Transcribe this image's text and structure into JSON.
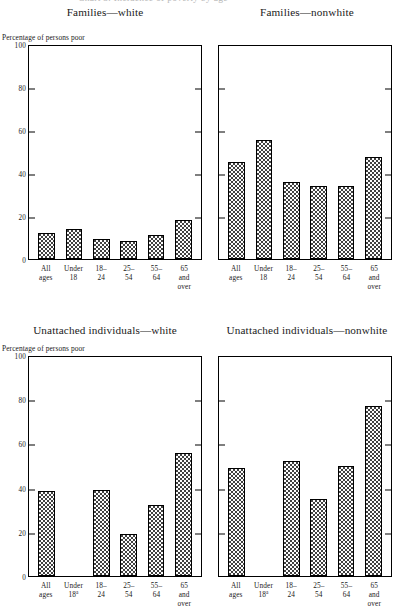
{
  "page": {
    "cut_off_header": "Chart 3. Incidence of poverty by age",
    "axis_caption": "Percentage of persons poor",
    "footnote_marker": "a"
  },
  "chart_data": [
    {
      "type": "bar",
      "title": "Families—white",
      "ylabel": "Percentage of persons poor",
      "xlabel": "",
      "categories": [
        "All ages",
        "Under 18",
        "18–24",
        "25–54",
        "55–64",
        "65 and over"
      ],
      "category_lines": [
        [
          "All",
          "ages"
        ],
        [
          "Under",
          "18"
        ],
        [
          "18–",
          "24"
        ],
        [
          "25–",
          "54"
        ],
        [
          "55–",
          "64"
        ],
        [
          "65",
          "and",
          "over"
        ]
      ],
      "values": [
        12,
        14,
        9.5,
        8.5,
        11,
        18
      ],
      "ylim": [
        0,
        100
      ],
      "yticks": [
        0,
        20,
        40,
        60,
        80,
        100
      ],
      "ytick_labels": [
        "0",
        "20",
        "40",
        "60",
        "80",
        "100"
      ],
      "grid": false,
      "legend": "none"
    },
    {
      "type": "bar",
      "title": "Families—nonwhite",
      "ylabel": "",
      "xlabel": "",
      "categories": [
        "All ages",
        "Under 18",
        "18–24",
        "25–54",
        "55–64",
        "65 and over"
      ],
      "category_lines": [
        [
          "All",
          "ages"
        ],
        [
          "Under",
          "18"
        ],
        [
          "18–",
          "24"
        ],
        [
          "25–",
          "54"
        ],
        [
          "55–",
          "64"
        ],
        [
          "65",
          "and",
          "over"
        ]
      ],
      "values": [
        45,
        55.5,
        36,
        34,
        34,
        47.5
      ],
      "ylim": [
        0,
        100
      ],
      "yticks": [
        0,
        20,
        40,
        60,
        80,
        100
      ],
      "ytick_labels": [
        "",
        "",
        "",
        "",
        "",
        ""
      ],
      "grid": false,
      "legend": "none"
    },
    {
      "type": "bar",
      "title": "Unattached individuals—white",
      "ylabel": "Percentage of persons poor",
      "xlabel": "",
      "categories": [
        "All ages",
        "Under 18a",
        "18–24",
        "25–54",
        "55–64",
        "65 and over"
      ],
      "category_lines": [
        [
          "All",
          "ages"
        ],
        [
          "Under",
          "18a"
        ],
        [
          "18–",
          "24"
        ],
        [
          "25–",
          "54"
        ],
        [
          "55–",
          "64"
        ],
        [
          "65",
          "and",
          "over"
        ]
      ],
      "values": [
        38.5,
        null,
        39,
        19,
        32,
        55.5
      ],
      "ylim": [
        0,
        100
      ],
      "yticks": [
        0,
        20,
        40,
        60,
        80,
        100
      ],
      "ytick_labels": [
        "0",
        "20",
        "40",
        "60",
        "80",
        "100"
      ],
      "grid": false,
      "legend": "none"
    },
    {
      "type": "bar",
      "title": "Unattached individuals—nonwhite",
      "ylabel": "",
      "xlabel": "",
      "categories": [
        "All ages",
        "Under 18a",
        "18–24",
        "25–54",
        "55–64",
        "65 and over"
      ],
      "category_lines": [
        [
          "All",
          "ages"
        ],
        [
          "Under",
          "18a"
        ],
        [
          "18–",
          "24"
        ],
        [
          "25–",
          "54"
        ],
        [
          "55–",
          "64"
        ],
        [
          "65",
          "and",
          "over"
        ]
      ],
      "values": [
        49,
        null,
        52,
        35,
        50,
        77
      ],
      "ylim": [
        0,
        100
      ],
      "yticks": [
        0,
        20,
        40,
        60,
        80,
        100
      ],
      "ytick_labels": [
        "",
        "",
        "",
        "",
        "",
        ""
      ],
      "grid": false,
      "legend": "none"
    }
  ]
}
